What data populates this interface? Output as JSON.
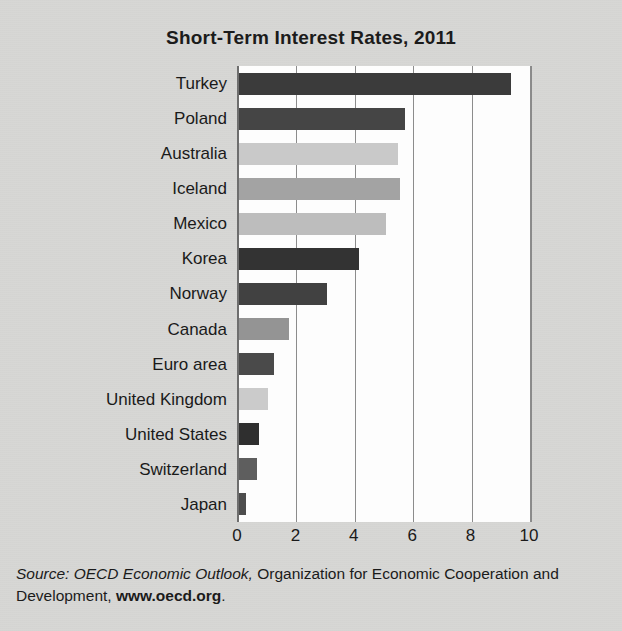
{
  "chart_data": {
    "type": "bar",
    "orientation": "horizontal",
    "title": "Short-Term Interest Rates, 2011",
    "xlabel": "",
    "ylabel": "",
    "xlim": [
      0,
      10
    ],
    "xticks": [
      "0",
      "2",
      "4",
      "6",
      "8",
      "10"
    ],
    "xtick_values": [
      0,
      2,
      4,
      6,
      8,
      10
    ],
    "grid": "vertical",
    "legend": "none",
    "categories": [
      "Turkey",
      "Poland",
      "Australia",
      "Iceland",
      "Mexico",
      "Korea",
      "Norway",
      "Canada",
      "Euro area",
      "United Kingdom",
      "United States",
      "Switzerland",
      "Japan"
    ],
    "values": [
      9.3,
      5.7,
      5.45,
      5.5,
      5.05,
      4.1,
      3.0,
      1.7,
      1.2,
      1.0,
      0.7,
      0.6,
      0.25
    ],
    "bar_colors": [
      "#3b3b3b",
      "#454545",
      "#c9c9c9",
      "#a3a3a3",
      "#bdbdbd",
      "#333333",
      "#414141",
      "#949494",
      "#4a4a4a",
      "#cbcbcb",
      "#2f2f2f",
      "#5e5e5e",
      "#4d4d4d"
    ]
  },
  "source": {
    "prefix": "Source: OECD Economic Outlook,",
    "middle": " Organization for Economic Cooperation and Development, ",
    "url": "www.oecd.org",
    "suffix": "."
  }
}
